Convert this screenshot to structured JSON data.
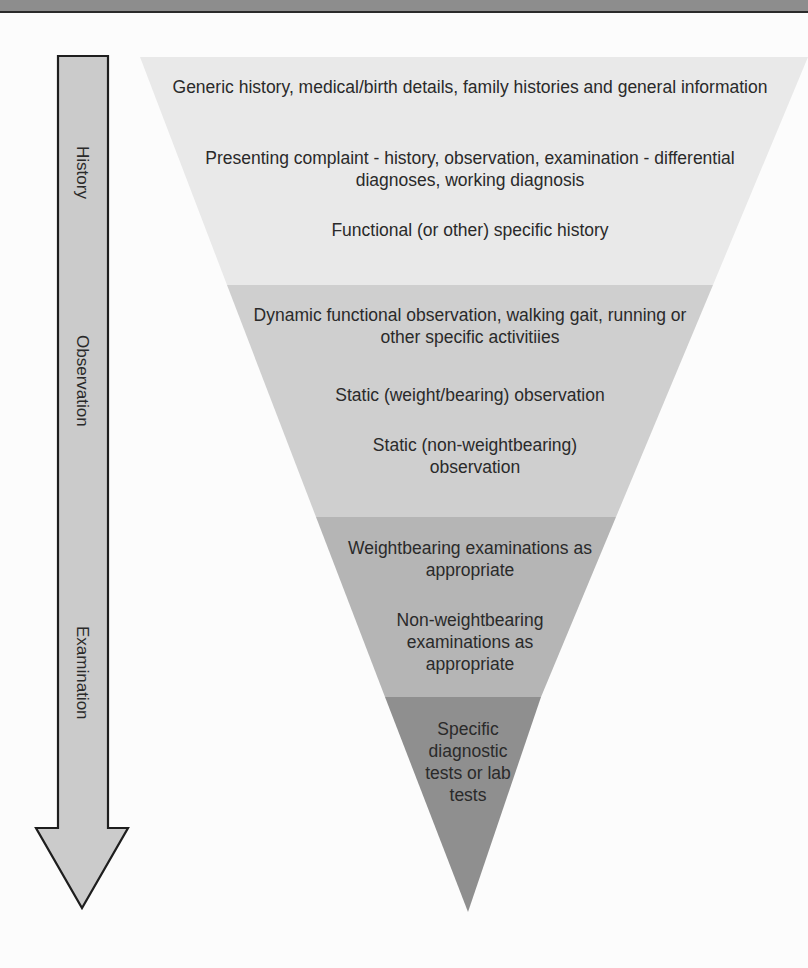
{
  "arrow": {
    "labels": [
      "History",
      "Observation",
      "Examination"
    ]
  },
  "funnel": {
    "bands": [
      {
        "name": "history",
        "color": "#e9e9e9",
        "items": [
          "Generic history, medical/birth details, family histories and general information",
          "Presenting complaint - history, observation, examination - differential diagnoses, working diagnosis",
          "Functional (or other) specific history"
        ]
      },
      {
        "name": "observation",
        "color": "#cfcfcf",
        "items": [
          "Dynamic functional observation, walking gait, running or other specific activitiies",
          "Static (weight/bearing) observation",
          "Static (non-weightbearing) observation"
        ]
      },
      {
        "name": "examination",
        "color": "#b5b5b5",
        "items": [
          "Weightbearing examinations as appropriate",
          "Non-weightbearing examinations as appropriate"
        ]
      },
      {
        "name": "specific-tests",
        "color": "#8f8f8f",
        "items": [
          "Specific diagnostic tests or lab tests"
        ]
      }
    ]
  }
}
